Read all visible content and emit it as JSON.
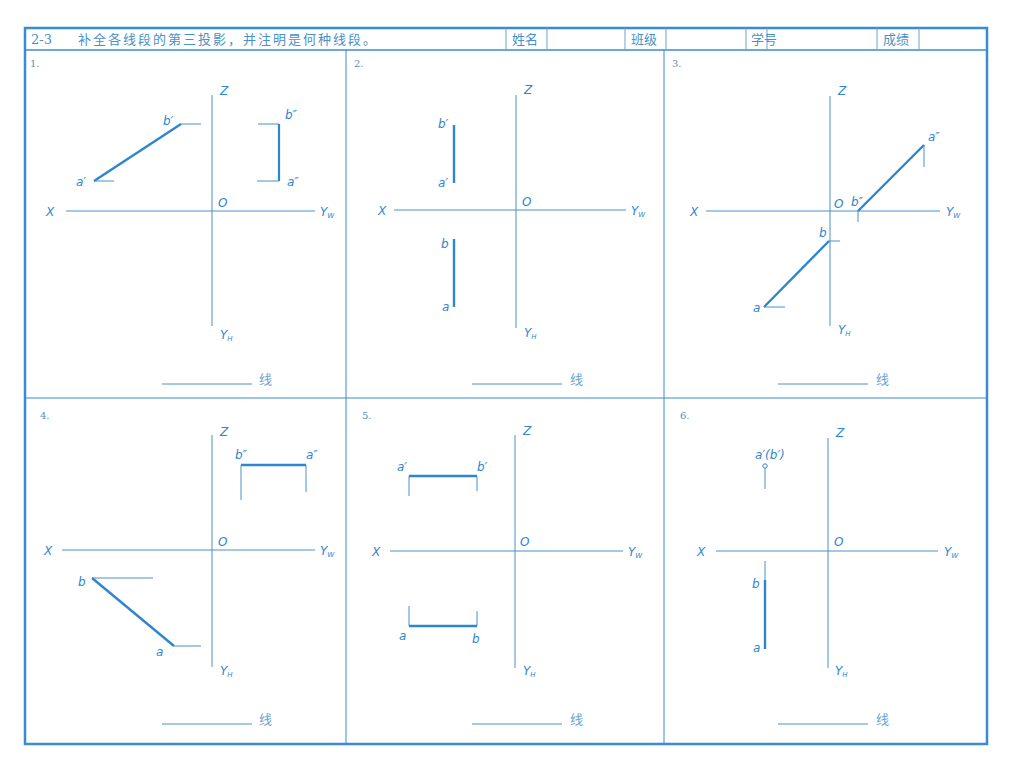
{
  "header": {
    "exercise_number": "2-3",
    "title": "补全各线段的第三投影，并注明是何种线段。",
    "fields": [
      {
        "label": "姓名",
        "value": ""
      },
      {
        "label": "班级",
        "value": ""
      },
      {
        "label": "学号",
        "value": ""
      },
      {
        "label": "成绩",
        "value": ""
      }
    ]
  },
  "axis_labels": {
    "x": "X",
    "z": "Z",
    "origin": "O",
    "yw": "Y",
    "yw_sub": "W",
    "yh": "Y",
    "yh_sub": "H"
  },
  "answer_suffix": "线",
  "colors": {
    "line": "#2f86d0",
    "border": "#3b8bd1",
    "text": "#4a90c8"
  },
  "problems": [
    {
      "number": "1.",
      "labels": {
        "b1": "b′",
        "a1": "a′",
        "b2": "b″",
        "a2": "a″"
      },
      "answer": ""
    },
    {
      "number": "2.",
      "labels": {
        "b1": "b′",
        "a1": "a′",
        "b": "b",
        "a": "a"
      },
      "answer": ""
    },
    {
      "number": "3.",
      "labels": {
        "a2": "a″",
        "b2": "b″",
        "b": "b",
        "a": "a"
      },
      "answer": ""
    },
    {
      "number": "4.",
      "labels": {
        "b2": "b″",
        "a2": "a″",
        "b": "b",
        "a": "a"
      },
      "answer": ""
    },
    {
      "number": "5.",
      "labels": {
        "a1": "a′",
        "b1": "b′",
        "a": "a",
        "b": "b"
      },
      "answer": ""
    },
    {
      "number": "6.",
      "labels": {
        "ab1": "a′(b′)",
        "b": "b",
        "a": "a"
      },
      "answer": ""
    }
  ]
}
